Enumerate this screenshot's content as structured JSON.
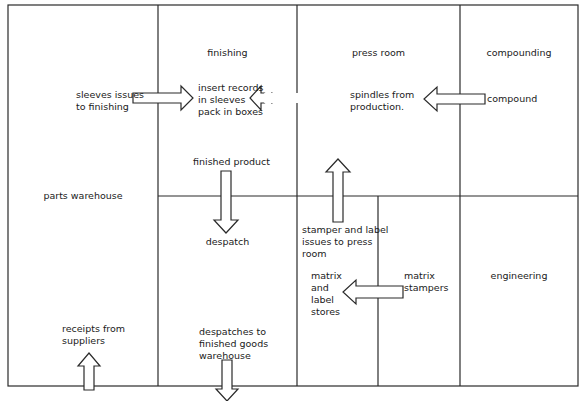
{
  "diagram": {
    "title": "",
    "colors": {
      "line": "#2a2a2a",
      "background": "#ffffff"
    },
    "rooms": [
      {
        "id": "parts-warehouse",
        "label": "parts warehouse"
      },
      {
        "id": "finishing",
        "label": "finishing"
      },
      {
        "id": "press-room",
        "label": "press room"
      },
      {
        "id": "compounding",
        "label": "compounding"
      },
      {
        "id": "despatch",
        "label": "despatch"
      },
      {
        "id": "matrix-label-stores",
        "label": "matrix\nand\nlabel\nstores"
      },
      {
        "id": "matrix-stampers",
        "label": "matrix\nstampers"
      },
      {
        "id": "engineering",
        "label": "engineering"
      }
    ],
    "annotations": {
      "sleeves": "sleeves issues\nto finishing",
      "insert": "insert records\nin sleeves\npack in boxes",
      "spindles": "spindles from\nproduction.",
      "compound": "compound",
      "finished_product": "finished product",
      "stamper_label": "stamper and label\nissues to press\nroom",
      "receipts": "receipts from\nsuppliers",
      "despatches": "despatches to\nfinished goods\nwarehouse"
    },
    "flows": [
      {
        "from": "parts-warehouse",
        "to": "finishing",
        "label": "sleeves issues to finishing",
        "direction": "right"
      },
      {
        "from": "press-room",
        "to": "finishing",
        "label": "spindles from production.",
        "direction": "left"
      },
      {
        "from": "compounding",
        "to": "press-room",
        "label": "compound",
        "direction": "left"
      },
      {
        "from": "finishing",
        "to": "despatch",
        "label": "finished product",
        "direction": "down"
      },
      {
        "from": "matrix-label-stores",
        "to": "press-room",
        "label": "stamper and label issues to press room",
        "direction": "up"
      },
      {
        "from": "matrix-stampers",
        "to": "matrix-label-stores",
        "label": "",
        "direction": "left"
      },
      {
        "from": "outside",
        "to": "parts-warehouse",
        "label": "receipts from suppliers",
        "direction": "up"
      },
      {
        "from": "despatch",
        "to": "outside",
        "label": "despatches to finished goods warehouse",
        "direction": "down"
      }
    ]
  }
}
